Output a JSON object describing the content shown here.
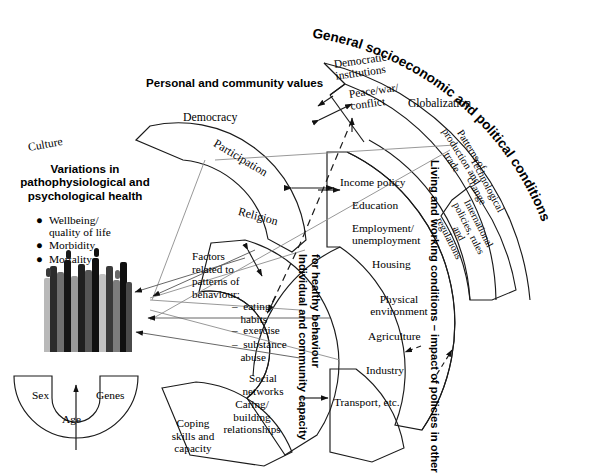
{
  "figure": {
    "title_left_block": {
      "heading": "Variations in\npathophysiological and\npsychological health",
      "bullets": [
        "Wellbeing/\nquality of life",
        "Morbidity",
        "Mortality"
      ]
    },
    "base_layer": {
      "labels": [
        "Sex",
        "Genes",
        "Age"
      ]
    },
    "arcs": [
      {
        "id": "personal-community-values",
        "band_title": "Personal and community values",
        "band_title_style": "straight-above",
        "items": [
          "Culture",
          "Democracy",
          "Participation",
          "Religion"
        ]
      },
      {
        "id": "individual-community-capacity",
        "band_title": "Individual and community capacity\nfor healthy behaviour",
        "band_title_style": "vertical",
        "items": [
          "Factors\nrelated to\npatterns of\nbehaviour:",
          "–  eating\n   habits",
          "–  exercise",
          "–  substance\n   abuse",
          "Social\nnetworks",
          "Caring/\nbuilding\nrelationships",
          "Coping\nskills and\ncapacity"
        ]
      },
      {
        "id": "living-and-working-conditions",
        "band_title": "Living and working conditions – impact of policies in other sectors",
        "band_title_style": "vertical",
        "items": [
          "Income policy",
          "Education",
          "Employment/\nunemployment",
          "Housing",
          "Physical\nenvironment",
          "Agriculture",
          "Industry",
          "Transport, etc."
        ]
      },
      {
        "id": "general-socioeconomic-political",
        "band_title": "General socioeconomic and political conditions",
        "band_title_style": "curved-outer",
        "items": [
          "Democratic\ninstitutions",
          "Peace/war/\nconflict",
          "Globalization",
          "Patterns of\nproduction and\ntrade",
          "Technological\nchange",
          "International\npolicies, rules\nand\nregulations"
        ]
      }
    ],
    "curved_band_labels": {
      "general": "General socioeconomic and political conditions",
      "living": "Living and working conditions – impact of policies in other sectors",
      "capacity_line1": "Individual and community capacity",
      "capacity_line2": "for healthy behaviour"
    },
    "crowd_illustration": {
      "name": "crowd-of-people",
      "figure_count": 13,
      "palette": [
        "#1a1a1a",
        "#3d3d3d",
        "#606060",
        "#8a8a8a",
        "#b0b0b0",
        "#d0d0d0"
      ]
    },
    "colors": {
      "stroke": "#1a1a1a",
      "thin_gray": "#8c8c8c",
      "background": "#ffffff"
    }
  }
}
